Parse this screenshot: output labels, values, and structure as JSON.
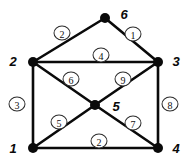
{
  "figure": {
    "kind": "weighted-undirected-graph",
    "background_color": "#ffffff",
    "ink_color": "#0a0a0a",
    "width": 189,
    "height": 166
  },
  "chart_data": {
    "type": "diagram",
    "title": "",
    "xlabel": "",
    "ylabel": "",
    "graph_type": "weighted undirected graph",
    "nodes": [
      {
        "id": "1",
        "label": "1",
        "x": 33,
        "y": 148,
        "label_x": 13,
        "label_y": 148
      },
      {
        "id": "2",
        "label": "2",
        "x": 33,
        "y": 62,
        "label_x": 13,
        "label_y": 61
      },
      {
        "id": "3",
        "label": "3",
        "x": 158,
        "y": 62,
        "label_x": 176,
        "label_y": 61
      },
      {
        "id": "4",
        "label": "4",
        "x": 158,
        "y": 148,
        "label_x": 176,
        "label_y": 148
      },
      {
        "id": "5",
        "label": "5",
        "x": 95,
        "y": 105,
        "label_x": 116,
        "label_y": 106
      },
      {
        "id": "6",
        "label": "6",
        "x": 105,
        "y": 18,
        "label_x": 124,
        "label_y": 14
      }
    ],
    "edges": [
      {
        "source": "2",
        "target": "6",
        "weight": "2",
        "label_x": 62,
        "label_y": 33
      },
      {
        "source": "6",
        "target": "3",
        "weight": "1",
        "label_x": 133,
        "label_y": 34
      },
      {
        "source": "2",
        "target": "3",
        "weight": "4",
        "label_x": 101,
        "label_y": 55
      },
      {
        "source": "1",
        "target": "2",
        "weight": "3",
        "label_x": 17,
        "label_y": 104
      },
      {
        "source": "3",
        "target": "4",
        "weight": "8",
        "label_x": 170,
        "label_y": 104
      },
      {
        "source": "2",
        "target": "5",
        "weight": "6",
        "label_x": 71,
        "label_y": 79
      },
      {
        "source": "3",
        "target": "5",
        "weight": "9",
        "label_x": 123,
        "label_y": 79
      },
      {
        "source": "1",
        "target": "5",
        "weight": "5",
        "label_x": 59,
        "label_y": 122
      },
      {
        "source": "4",
        "target": "5",
        "weight": "7",
        "label_x": 133,
        "label_y": 123
      },
      {
        "source": "1",
        "target": "4",
        "weight": "2",
        "label_x": 99,
        "label_y": 141
      }
    ],
    "node_radius": 5,
    "edge_stroke_width": 2.6,
    "legend": null,
    "grid": false
  }
}
